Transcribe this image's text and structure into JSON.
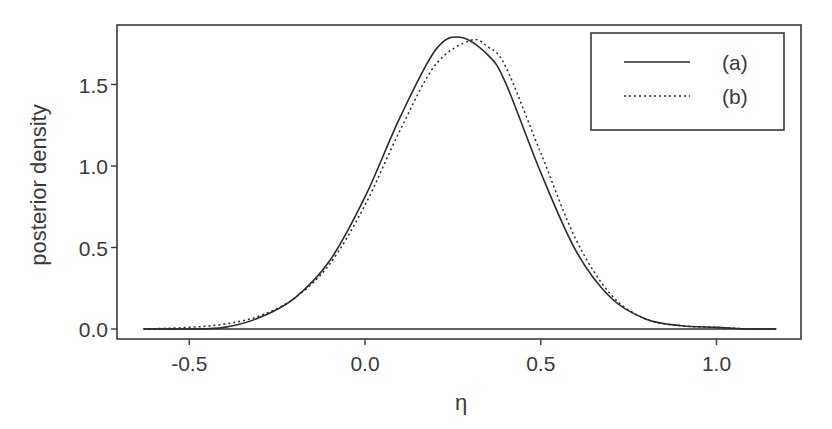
{
  "chart_data": {
    "type": "line",
    "title": "",
    "xlabel": "η",
    "ylabel": "posterior density",
    "xlim": [
      -0.72,
      1.24
    ],
    "ylim": [
      -0.06,
      1.87
    ],
    "grid": false,
    "legend_position": "top-right",
    "xticks": [
      -0.5,
      0.0,
      0.5,
      1.0
    ],
    "xtick_labels": [
      "-0.5",
      "0.0",
      "0.5",
      "1.0"
    ],
    "yticks": [
      0.0,
      0.5,
      1.0,
      1.5
    ],
    "ytick_labels": [
      "0.0",
      "0.5",
      "1.0",
      "1.5"
    ],
    "x_range_of_curves": [
      -0.63,
      1.17
    ],
    "baseline": {
      "y": 0.0,
      "x_from": -0.63,
      "x_to": 1.17
    },
    "series": [
      {
        "name": "(a)",
        "style": "solid",
        "description": "approximately normal, mode ~0.27, peak ~1.79",
        "x": [
          -0.63,
          -0.5,
          -0.4,
          -0.3,
          -0.2,
          -0.1,
          0.0,
          0.1,
          0.2,
          0.27,
          0.35,
          0.4,
          0.5,
          0.6,
          0.7,
          0.8,
          0.9,
          1.0,
          1.1,
          1.17
        ],
        "y": [
          0.0,
          0.0,
          0.01,
          0.07,
          0.19,
          0.42,
          0.81,
          1.3,
          1.71,
          1.79,
          1.68,
          1.51,
          0.96,
          0.48,
          0.19,
          0.06,
          0.02,
          0.01,
          0.0,
          0.0
        ]
      },
      {
        "name": "(b)",
        "style": "dotted",
        "description": "slightly shifted right with heavier left tail, mode ~0.30, peak ~1.77",
        "x": [
          -0.63,
          -0.5,
          -0.4,
          -0.3,
          -0.2,
          -0.1,
          0.0,
          0.1,
          0.2,
          0.3,
          0.35,
          0.4,
          0.5,
          0.6,
          0.7,
          0.8,
          0.9,
          1.0,
          1.1,
          1.17
        ],
        "y": [
          0.0,
          0.01,
          0.03,
          0.08,
          0.19,
          0.4,
          0.76,
          1.22,
          1.62,
          1.77,
          1.73,
          1.61,
          1.08,
          0.55,
          0.21,
          0.06,
          0.02,
          0.01,
          0.0,
          0.0
        ]
      }
    ],
    "legend": [
      {
        "label": "(a)",
        "style": "solid"
      },
      {
        "label": "(b)",
        "style": "dotted"
      }
    ]
  },
  "colors": {
    "line": "#2b2b2b",
    "frame": "#3a3a3a",
    "text": "#3a3a3a"
  }
}
